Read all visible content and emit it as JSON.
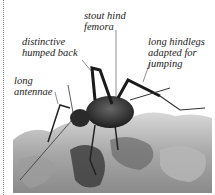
{
  "figure": {
    "labels": [
      {
        "id": "stout-hind-femora",
        "lines": [
          "stout hind",
          "femora"
        ]
      },
      {
        "id": "distinctive-humped-back",
        "lines": [
          "distinctive",
          "humped back"
        ]
      },
      {
        "id": "long-hindlegs",
        "lines": [
          "long hindlegs",
          "adapted for",
          "jumping"
        ]
      },
      {
        "id": "long-antennae",
        "lines": [
          "long",
          "antennae"
        ]
      }
    ]
  }
}
